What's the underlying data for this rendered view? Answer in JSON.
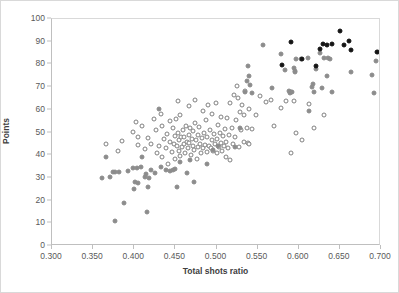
{
  "chart_data": {
    "type": "scatter",
    "title": "",
    "xlabel": "Total shots ratio",
    "ylabel": "Points",
    "xlim": [
      0.3,
      0.7
    ],
    "ylim": [
      0,
      100
    ],
    "xticks": [
      "0.300",
      "0.350",
      "0.400",
      "0.450",
      "0.500",
      "0.550",
      "0.600",
      "0.650",
      "0.700"
    ],
    "xtick_values": [
      0.3,
      0.35,
      0.4,
      0.45,
      0.5,
      0.55,
      0.6,
      0.65,
      0.7
    ],
    "yticks": [
      "0",
      "10",
      "20",
      "30",
      "40",
      "50",
      "60",
      "70",
      "80",
      "90",
      "100"
    ],
    "ytick_values": [
      0,
      10,
      20,
      30,
      40,
      50,
      60,
      70,
      80,
      90,
      100
    ],
    "grid": false,
    "legend": "none",
    "colors": {
      "open_marker_edge": "#808080",
      "open_marker_fill": "#ffffff",
      "gray_marker": "#8c8c8c",
      "black_marker": "#141414",
      "axis": "#bfbfbf",
      "tick_text": "#595959",
      "axis_title": "#404040",
      "background": "#ffffff"
    },
    "series": [
      {
        "name": "open-circle-series",
        "marker": "open-circle",
        "points": [
          [
            0.366,
            44.8
          ],
          [
            0.385,
            46.2
          ],
          [
            0.38,
            42.0
          ],
          [
            0.399,
            50.2
          ],
          [
            0.402,
            54.5
          ],
          [
            0.404,
            48.0
          ],
          [
            0.405,
            44.5
          ],
          [
            0.409,
            52.8
          ],
          [
            0.413,
            42.8
          ],
          [
            0.417,
            47.5
          ],
          [
            0.42,
            45.0
          ],
          [
            0.424,
            56.0
          ],
          [
            0.426,
            51.0
          ],
          [
            0.428,
            41.0
          ],
          [
            0.43,
            44.0
          ],
          [
            0.432,
            58.3
          ],
          [
            0.434,
            53.0
          ],
          [
            0.434,
            39.0
          ],
          [
            0.436,
            47.0
          ],
          [
            0.438,
            43.0
          ],
          [
            0.44,
            49.5
          ],
          [
            0.441,
            36.2
          ],
          [
            0.443,
            55.0
          ],
          [
            0.444,
            46.0
          ],
          [
            0.446,
            41.5
          ],
          [
            0.447,
            52.0
          ],
          [
            0.448,
            44.8
          ],
          [
            0.449,
            38.5
          ],
          [
            0.45,
            48.5
          ],
          [
            0.451,
            56.0
          ],
          [
            0.452,
            44.0
          ],
          [
            0.453,
            50.0
          ],
          [
            0.453,
            64.0
          ],
          [
            0.454,
            42.0
          ],
          [
            0.455,
            46.5
          ],
          [
            0.456,
            39.5
          ],
          [
            0.456,
            57.5
          ],
          [
            0.457,
            47.8
          ],
          [
            0.458,
            43.5
          ],
          [
            0.459,
            51.0
          ],
          [
            0.46,
            45.0
          ],
          [
            0.461,
            48.0
          ],
          [
            0.462,
            41.0
          ],
          [
            0.463,
            53.0
          ],
          [
            0.464,
            46.0
          ],
          [
            0.465,
            43.0
          ],
          [
            0.466,
            49.0
          ],
          [
            0.466,
            61.5
          ],
          [
            0.467,
            45.5
          ],
          [
            0.468,
            52.0
          ],
          [
            0.469,
            40.0
          ],
          [
            0.47,
            47.0
          ],
          [
            0.471,
            44.0
          ],
          [
            0.472,
            50.5
          ],
          [
            0.473,
            42.5
          ],
          [
            0.474,
            64.5
          ],
          [
            0.474,
            54.0
          ],
          [
            0.475,
            46.5
          ],
          [
            0.476,
            38.5
          ],
          [
            0.477,
            49.0
          ],
          [
            0.478,
            43.8
          ],
          [
            0.479,
            52.5
          ],
          [
            0.48,
            45.0
          ],
          [
            0.481,
            41.0
          ],
          [
            0.482,
            47.5
          ],
          [
            0.483,
            59.5
          ],
          [
            0.484,
            43.0
          ],
          [
            0.485,
            50.0
          ],
          [
            0.486,
            44.5
          ],
          [
            0.487,
            55.5
          ],
          [
            0.488,
            41.5
          ],
          [
            0.489,
            48.0
          ],
          [
            0.49,
            62.0
          ],
          [
            0.491,
            44.0
          ],
          [
            0.492,
            51.0
          ],
          [
            0.493,
            43.0
          ],
          [
            0.494,
            46.8
          ],
          [
            0.495,
            58.0
          ],
          [
            0.496,
            42.0
          ],
          [
            0.497,
            49.5
          ],
          [
            0.498,
            45.0
          ],
          [
            0.499,
            63.0
          ],
          [
            0.5,
            41.0
          ],
          [
            0.501,
            47.0
          ],
          [
            0.502,
            53.5
          ],
          [
            0.503,
            43.5
          ],
          [
            0.504,
            50.0
          ],
          [
            0.505,
            45.5
          ],
          [
            0.506,
            57.0
          ],
          [
            0.507,
            42.0
          ],
          [
            0.508,
            48.5
          ],
          [
            0.509,
            44.0
          ],
          [
            0.51,
            51.5
          ],
          [
            0.511,
            39.0
          ],
          [
            0.512,
            46.0
          ],
          [
            0.513,
            56.5
          ],
          [
            0.514,
            43.0
          ],
          [
            0.515,
            49.0
          ],
          [
            0.516,
            37.8
          ],
          [
            0.517,
            63.0
          ],
          [
            0.519,
            52.0
          ],
          [
            0.52,
            45.0
          ],
          [
            0.521,
            66.5
          ],
          [
            0.522,
            48.0
          ],
          [
            0.524,
            55.5
          ],
          [
            0.525,
            70.5
          ],
          [
            0.526,
            65.0
          ],
          [
            0.527,
            43.5
          ],
          [
            0.528,
            59.0
          ],
          [
            0.53,
            51.0
          ],
          [
            0.531,
            62.0
          ],
          [
            0.533,
            46.0
          ],
          [
            0.534,
            57.5
          ],
          [
            0.535,
            68.5
          ],
          [
            0.537,
            52.0
          ],
          [
            0.538,
            45.5
          ],
          [
            0.539,
            60.5
          ],
          [
            0.54,
            44.8
          ],
          [
            0.543,
            51.5
          ],
          [
            0.548,
            57.5
          ],
          [
            0.553,
            66.0
          ],
          [
            0.56,
            63.5
          ],
          [
            0.566,
            64.5
          ],
          [
            0.57,
            52.8
          ],
          [
            0.578,
            60.8
          ],
          [
            0.584,
            63.8
          ],
          [
            0.591,
            40.8
          ],
          [
            0.594,
            64.0
          ],
          [
            0.597,
            50.0
          ],
          [
            0.604,
            46.5
          ],
          [
            0.612,
            62.5
          ],
          [
            0.618,
            51.8
          ],
          [
            0.631,
            57.5
          ]
        ]
      },
      {
        "name": "gray-filled-series",
        "marker": "filled-gray-circle",
        "points": [
          [
            0.361,
            30.0
          ],
          [
            0.366,
            39.0
          ],
          [
            0.37,
            30.2
          ],
          [
            0.374,
            32.8
          ],
          [
            0.376,
            32.8
          ],
          [
            0.377,
            11.0
          ],
          [
            0.381,
            32.5
          ],
          [
            0.388,
            19.0
          ],
          [
            0.392,
            33.0
          ],
          [
            0.399,
            34.5
          ],
          [
            0.401,
            28.2
          ],
          [
            0.403,
            34.3
          ],
          [
            0.405,
            27.8
          ],
          [
            0.4,
            25.0
          ],
          [
            0.408,
            35.0
          ],
          [
            0.409,
            39.0
          ],
          [
            0.413,
            30.5
          ],
          [
            0.414,
            31.5
          ],
          [
            0.415,
            14.8
          ],
          [
            0.417,
            26.0
          ],
          [
            0.418,
            30.0
          ],
          [
            0.42,
            33.5
          ],
          [
            0.425,
            32.0
          ],
          [
            0.43,
            60.5
          ],
          [
            0.433,
            34.8
          ],
          [
            0.438,
            33.5
          ],
          [
            0.443,
            33.0
          ],
          [
            0.447,
            33.5
          ],
          [
            0.45,
            34.0
          ],
          [
            0.452,
            26.0
          ],
          [
            0.456,
            37.0
          ],
          [
            0.464,
            32.0
          ],
          [
            0.468,
            38.0
          ],
          [
            0.473,
            28.0
          ],
          [
            0.489,
            36.0
          ],
          [
            0.496,
            42.5
          ],
          [
            0.502,
            44.0
          ],
          [
            0.523,
            43.5
          ],
          [
            0.529,
            52.0
          ],
          [
            0.535,
            68.0
          ],
          [
            0.537,
            72.5
          ],
          [
            0.538,
            79.5
          ],
          [
            0.54,
            75.0
          ],
          [
            0.541,
            71.0
          ],
          [
            0.543,
            67.5
          ],
          [
            0.556,
            88.5
          ],
          [
            0.567,
            69.5
          ],
          [
            0.579,
            84.5
          ],
          [
            0.583,
            77.5
          ],
          [
            0.588,
            68.2
          ],
          [
            0.589,
            67.5
          ],
          [
            0.591,
            68.0
          ],
          [
            0.592,
            67.8
          ],
          [
            0.594,
            78.5
          ],
          [
            0.595,
            77.0
          ],
          [
            0.596,
            76.5
          ],
          [
            0.597,
            82.5
          ],
          [
            0.603,
            82.5
          ],
          [
            0.611,
            82.8
          ],
          [
            0.613,
            59.5
          ],
          [
            0.616,
            70.0
          ],
          [
            0.617,
            71.5
          ],
          [
            0.619,
            67.8
          ],
          [
            0.621,
            77.8
          ],
          [
            0.626,
            85.0
          ],
          [
            0.628,
            69.5
          ],
          [
            0.631,
            82.8
          ],
          [
            0.634,
            75.0
          ],
          [
            0.636,
            82.8
          ],
          [
            0.638,
            82.5
          ],
          [
            0.641,
            67.8
          ],
          [
            0.664,
            76.8
          ],
          [
            0.689,
            75.5
          ],
          [
            0.691,
            67.5
          ],
          [
            0.694,
            81.5
          ],
          [
            0.696,
            85.5
          ]
        ]
      },
      {
        "name": "black-filled-series",
        "marker": "filled-black-circle",
        "points": [
          [
            0.58,
            79.8
          ],
          [
            0.591,
            89.8
          ],
          [
            0.604,
            82.5
          ],
          [
            0.621,
            79.5
          ],
          [
            0.626,
            86.8
          ],
          [
            0.629,
            88.8
          ],
          [
            0.634,
            88.5
          ],
          [
            0.641,
            88.8
          ],
          [
            0.65,
            94.8
          ],
          [
            0.655,
            88.5
          ],
          [
            0.661,
            90.5
          ],
          [
            0.663,
            86.5
          ],
          [
            0.695,
            85.5
          ]
        ]
      }
    ]
  }
}
